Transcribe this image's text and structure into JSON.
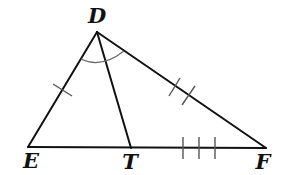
{
  "diagram": {
    "type": "triangle-with-angle-bisector",
    "line_color": "#111111",
    "mark_color": "#555555",
    "vertices": {
      "D": {
        "label": "D",
        "x": 97,
        "y": 32,
        "label_x": 97,
        "label_y": 15
      },
      "E": {
        "label": "E",
        "x": 28,
        "y": 147,
        "label_x": 31,
        "label_y": 160
      },
      "T": {
        "label": "T",
        "x": 131,
        "y": 148,
        "label_x": 130,
        "label_y": 161
      },
      "F": {
        "label": "F",
        "x": 266,
        "y": 148,
        "label_x": 263,
        "label_y": 161
      }
    },
    "segments": [
      {
        "name": "DE",
        "from": "D",
        "to": "E"
      },
      {
        "name": "DF",
        "from": "D",
        "to": "F"
      },
      {
        "name": "EF",
        "from": "E",
        "to": "F"
      },
      {
        "name": "DT",
        "from": "D",
        "to": "T"
      }
    ],
    "tick_marks": [
      {
        "segment": "DE",
        "count": 1
      },
      {
        "segment": "DF",
        "count": 2
      },
      {
        "segment": "TF",
        "count": 3
      }
    ],
    "angle_marks": [
      {
        "vertex": "D",
        "between": [
          "E",
          "F"
        ],
        "arcs": 1
      }
    ]
  }
}
